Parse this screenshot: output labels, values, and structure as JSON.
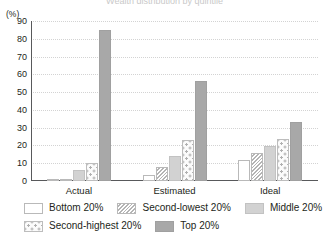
{
  "chart_data": {
    "type": "bar",
    "title": "Wealth distribution by quintile",
    "xlabel": "",
    "ylabel": "(%)",
    "ylim": [
      0,
      90
    ],
    "yticks": [
      0,
      10,
      20,
      30,
      40,
      50,
      60,
      70,
      80,
      90
    ],
    "grid": true,
    "legend_position": "bottom",
    "categories": [
      "Actual",
      "Estimated",
      "Ideal"
    ],
    "series": [
      {
        "name": "Bottom 20%",
        "values": [
          0.5,
          3.5,
          12.0
        ]
      },
      {
        "name": "Second-lowest 20%",
        "values": [
          0.8,
          8.0,
          16.0
        ]
      },
      {
        "name": "Middle 20%",
        "values": [
          6.0,
          14.0,
          19.5
        ]
      },
      {
        "name": "Second-highest 20%",
        "values": [
          10.0,
          23.0,
          23.5
        ]
      },
      {
        "name": "Top 20%",
        "values": [
          85.0,
          56.0,
          33.0
        ]
      }
    ]
  },
  "axis": {
    "unit_label": "(%)"
  },
  "legend": {
    "items": [
      {
        "label": "Bottom 20%"
      },
      {
        "label": "Second-lowest 20%"
      },
      {
        "label": "Middle 20%"
      },
      {
        "label": "Second-highest 20%"
      },
      {
        "label": "Top 20%"
      }
    ]
  }
}
